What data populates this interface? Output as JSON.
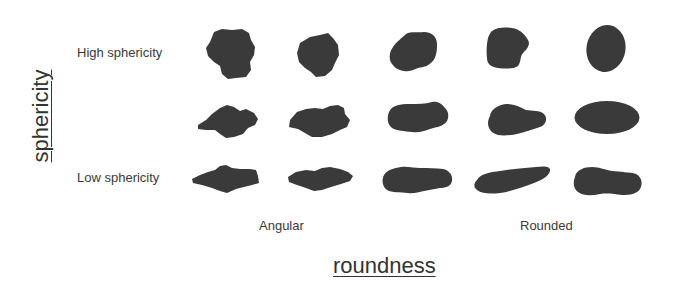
{
  "diagram": {
    "axes": {
      "y_title": "sphericity",
      "x_title": "roundness"
    },
    "row_labels": {
      "top": "High sphericity",
      "bottom": "Low sphericity"
    },
    "column_labels": {
      "left": "Angular",
      "right": "Rounded"
    },
    "grid": {
      "rows": 3,
      "columns": 5,
      "row_order": [
        "high sphericity",
        "medium sphericity",
        "low sphericity"
      ],
      "column_order": [
        "very angular",
        "angular",
        "sub-rounded",
        "rounded",
        "well rounded"
      ]
    },
    "particle_color": "#3a3a3a",
    "background_color": "#ffffff"
  }
}
